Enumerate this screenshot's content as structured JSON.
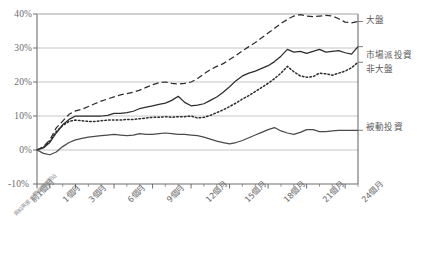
{
  "chart_data": {
    "type": "line",
    "title": "",
    "subtitle": "",
    "xlabel": "",
    "ylabel": "",
    "ylim": [
      -10,
      40
    ],
    "xlim": [
      0,
      25
    ],
    "grid": true,
    "grid_axis": "y",
    "legend_position": "right-inline",
    "ytick_labels": [
      "40%",
      "30%",
      "20%",
      "10%",
      "0%",
      "-10%"
    ],
    "ytick_values": [
      40,
      30,
      20,
      10,
      0,
      -10
    ],
    "xtick_labels": [
      "前1個月",
      "1個月",
      "3個月",
      "6個月",
      "9個月",
      "12個月",
      "15個月",
      "18個月",
      "21個月",
      "24個月"
    ],
    "xtick_values": [
      0,
      1,
      3,
      6,
      9,
      12,
      15,
      18,
      21,
      24
    ],
    "x": [
      0,
      0.5,
      1,
      1.5,
      2,
      2.5,
      3,
      3.5,
      4,
      4.5,
      5,
      5.5,
      6,
      6.5,
      7,
      7.5,
      8,
      8.5,
      9,
      9.5,
      10,
      10.5,
      11,
      11.5,
      12,
      12.5,
      13,
      13.5,
      14,
      14.5,
      15,
      15.5,
      16,
      16.5,
      17,
      17.5,
      18,
      18.5,
      19,
      19.5,
      20,
      20.5,
      21,
      21.5,
      22,
      22.5,
      23,
      23.5,
      24,
      24.5,
      25
    ],
    "source_note": "資料來源:公開資訊觀測站",
    "series": [
      {
        "name": "大盤",
        "style": "dashed",
        "color": "#2d2d2f",
        "label_x": 25,
        "values": [
          0,
          1.0,
          3.0,
          6.5,
          8.5,
          10.5,
          11.5,
          12.0,
          12.8,
          13.6,
          14.4,
          15.0,
          15.6,
          16.2,
          16.6,
          17.0,
          17.6,
          18.4,
          19.2,
          19.8,
          20.0,
          19.6,
          19.4,
          19.6,
          20.0,
          21.0,
          22.4,
          23.6,
          24.6,
          25.4,
          26.6,
          27.8,
          29.2,
          30.4,
          31.6,
          33.0,
          34.4,
          35.8,
          37.2,
          38.4,
          39.4,
          39.8,
          39.4,
          39.2,
          39.4,
          39.6,
          39.4,
          38.6,
          37.6,
          37.4,
          37.8
        ]
      },
      {
        "name": "市場派投資",
        "style": "solid",
        "color": "#2d2d2f",
        "label_x": 25,
        "values": [
          0,
          0.6,
          2.2,
          5.0,
          7.4,
          9.0,
          10.0,
          10.0,
          10.0,
          10.0,
          10.0,
          10.2,
          10.8,
          10.8,
          11.0,
          11.4,
          12.2,
          12.6,
          13.0,
          13.4,
          13.8,
          14.6,
          15.8,
          14.0,
          13.0,
          13.2,
          13.6,
          14.6,
          15.6,
          17.0,
          18.6,
          20.4,
          21.8,
          22.6,
          23.2,
          24.0,
          24.8,
          26.0,
          27.6,
          29.6,
          28.8,
          29.0,
          28.4,
          29.0,
          29.6,
          28.8,
          29.0,
          29.2,
          28.6,
          28.2,
          30.4
        ]
      },
      {
        "name": "非大盤",
        "style": "dotted",
        "color": "#2d2d2f",
        "label_x": 25,
        "values": [
          0,
          0.8,
          2.6,
          5.4,
          7.2,
          8.4,
          8.8,
          8.6,
          8.4,
          8.4,
          8.6,
          8.8,
          8.8,
          8.8,
          9.0,
          9.0,
          9.2,
          9.4,
          9.6,
          9.6,
          9.8,
          9.6,
          9.8,
          9.8,
          10.0,
          9.4,
          9.6,
          10.2,
          11.0,
          11.8,
          12.8,
          13.8,
          15.0,
          16.0,
          17.2,
          18.4,
          19.6,
          21.0,
          22.6,
          24.6,
          23.0,
          21.8,
          21.4,
          21.6,
          22.6,
          22.4,
          22.0,
          22.6,
          23.2,
          24.2,
          25.8
        ]
      },
      {
        "name": "被動投資",
        "style": "solid",
        "color": "#4a4a4c",
        "label_x": 25,
        "values": [
          0,
          -1.0,
          -1.4,
          -0.6,
          1.0,
          2.2,
          3.0,
          3.4,
          3.8,
          4.0,
          4.2,
          4.4,
          4.6,
          4.4,
          4.2,
          4.4,
          4.8,
          4.6,
          4.6,
          4.8,
          5.0,
          4.8,
          4.6,
          4.6,
          4.4,
          4.2,
          3.8,
          3.2,
          2.6,
          2.2,
          1.8,
          2.2,
          2.8,
          3.6,
          4.4,
          5.2,
          6.0,
          6.6,
          5.6,
          5.0,
          4.6,
          5.2,
          6.0,
          6.0,
          5.4,
          5.4,
          5.6,
          5.8,
          5.8,
          5.8,
          5.8
        ]
      }
    ]
  },
  "labels": {
    "legend_main": "大盤",
    "legend_activist": "市場派投資",
    "legend_nonmain": "非大盤",
    "legend_passive": "被動投資"
  }
}
